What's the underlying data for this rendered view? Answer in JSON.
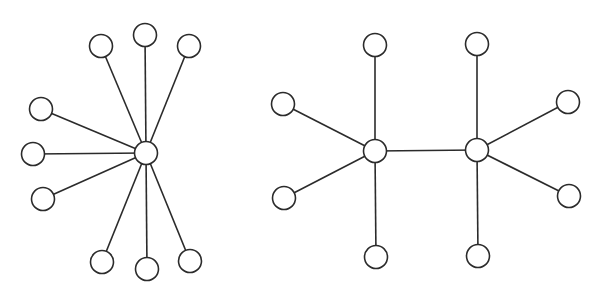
{
  "canvas": {
    "width": 607,
    "height": 294,
    "background": "#ffffff",
    "stroke": "#2b2b2b",
    "node_radius": 11.5
  },
  "graphs": [
    {
      "name": "star-graph",
      "description": "Star graph: one central hub connected to 9 leaves",
      "nodes": [
        {
          "id": "hub",
          "x": 146,
          "y": 153
        },
        {
          "id": "l1",
          "x": 101,
          "y": 46
        },
        {
          "id": "l2",
          "x": 145,
          "y": 35
        },
        {
          "id": "l3",
          "x": 189,
          "y": 46
        },
        {
          "id": "l4",
          "x": 41,
          "y": 109
        },
        {
          "id": "l5",
          "x": 33,
          "y": 154
        },
        {
          "id": "l6",
          "x": 43,
          "y": 199
        },
        {
          "id": "l7",
          "x": 102,
          "y": 262
        },
        {
          "id": "l8",
          "x": 147,
          "y": 269
        },
        {
          "id": "l9",
          "x": 190,
          "y": 261
        }
      ],
      "edges": [
        [
          "hub",
          "l1"
        ],
        [
          "hub",
          "l2"
        ],
        [
          "hub",
          "l3"
        ],
        [
          "hub",
          "l4"
        ],
        [
          "hub",
          "l5"
        ],
        [
          "hub",
          "l6"
        ],
        [
          "hub",
          "l7"
        ],
        [
          "hub",
          "l8"
        ],
        [
          "hub",
          "l9"
        ]
      ]
    },
    {
      "name": "double-star-graph",
      "description": "Double star: two adjacent hubs, each with 4 leaves",
      "nodes": [
        {
          "id": "h1",
          "x": 375,
          "y": 151
        },
        {
          "id": "h2",
          "x": 477,
          "y": 150
        },
        {
          "id": "a1",
          "x": 375,
          "y": 45
        },
        {
          "id": "a2",
          "x": 283,
          "y": 104
        },
        {
          "id": "a3",
          "x": 284,
          "y": 198
        },
        {
          "id": "a4",
          "x": 376,
          "y": 257
        },
        {
          "id": "b1",
          "x": 477,
          "y": 44
        },
        {
          "id": "b2",
          "x": 568,
          "y": 102
        },
        {
          "id": "b3",
          "x": 569,
          "y": 196
        },
        {
          "id": "b4",
          "x": 478,
          "y": 256
        }
      ],
      "edges": [
        [
          "h1",
          "h2"
        ],
        [
          "h1",
          "a1"
        ],
        [
          "h1",
          "a2"
        ],
        [
          "h1",
          "a3"
        ],
        [
          "h1",
          "a4"
        ],
        [
          "h2",
          "b1"
        ],
        [
          "h2",
          "b2"
        ],
        [
          "h2",
          "b3"
        ],
        [
          "h2",
          "b4"
        ]
      ]
    }
  ]
}
